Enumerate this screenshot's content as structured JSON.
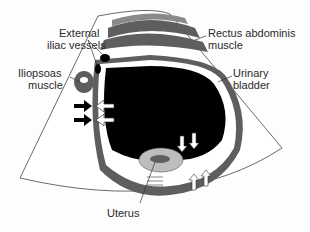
{
  "diagram": {
    "type": "transabdominal pelvic ultrasound schematic",
    "labels": {
      "external_iliac_vessels": {
        "line1": "External",
        "line2": "iliac vessels"
      },
      "iliopsoas_muscle": {
        "line1": "Iliopsoas",
        "line2": "muscle"
      },
      "rectus_abdominis_muscle": {
        "line1": "Rectus abdominis",
        "line2": "muscle"
      },
      "urinary_bladder": {
        "line1": "Urinary",
        "line2": "bladder"
      },
      "uterus": {
        "line1": "Uterus"
      }
    },
    "arrows": {
      "black_solid": 2,
      "white_outlined_left": 2,
      "white_down": 2,
      "white_up": 2
    },
    "colors": {
      "bladder": "#000000",
      "muscle": "#5e5e5e",
      "tissue_light": "#bdbdbd",
      "background": "#ffffff",
      "outline": "#333333"
    }
  }
}
